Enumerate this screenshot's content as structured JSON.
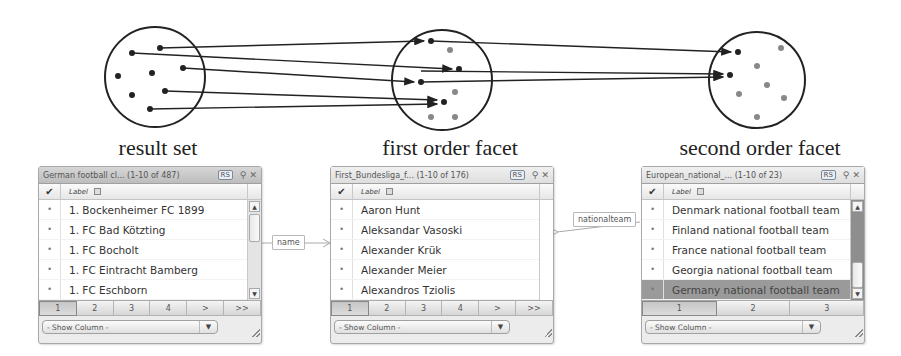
{
  "diagram": {
    "captions": {
      "result_set": "result set",
      "first_order": "first order facet",
      "second_order": "second order facet"
    }
  },
  "panels": [
    {
      "title": "German football cl...",
      "range": "(1-10 of 487)",
      "badge": "RS",
      "column_label": "Label",
      "rows": [
        {
          "label": "1. Bockenheimer FC 1899",
          "selected": false
        },
        {
          "label": "1. FC Bad Kötzting",
          "selected": false
        },
        {
          "label": "1. FC Bocholt",
          "selected": false
        },
        {
          "label": "1. FC Eintracht Bamberg",
          "selected": false
        },
        {
          "label": "1. FC Eschborn",
          "selected": false
        }
      ],
      "pages": [
        "1",
        "2",
        "3",
        "4",
        ">",
        ">>"
      ],
      "active_page": "1",
      "show_column": "- Show Column -"
    },
    {
      "title": "First_Bundesliga_f...",
      "range": "(1-10 of 176)",
      "badge": "RS",
      "column_label": "Label",
      "rows": [
        {
          "label": "Aaron Hunt",
          "selected": false
        },
        {
          "label": "Aleksandar Vasoski",
          "selected": false
        },
        {
          "label": "Alexander Krük",
          "selected": false
        },
        {
          "label": "Alexander Meier",
          "selected": false
        },
        {
          "label": "Alexandros Tziolis",
          "selected": false
        }
      ],
      "pages": [
        "1",
        "2",
        "3",
        "4",
        ">",
        ">>"
      ],
      "active_page": "1",
      "show_column": "- Show Column -"
    },
    {
      "title": "European_national_...",
      "range": "(1-10 of 23)",
      "badge": "RS",
      "column_label": "Label",
      "rows": [
        {
          "label": "Denmark national football team",
          "selected": false
        },
        {
          "label": "Finland national football team",
          "selected": false
        },
        {
          "label": "France national football team",
          "selected": false
        },
        {
          "label": "Georgia national football team",
          "selected": false
        },
        {
          "label": "Germany national football team",
          "selected": true
        }
      ],
      "pages": [
        "1",
        "2",
        "3"
      ],
      "active_page": "1",
      "show_column": "- Show Column -"
    }
  ],
  "edges": [
    {
      "label": "name"
    },
    {
      "label": "nationalteam"
    }
  ],
  "icons": {
    "check": "✔",
    "pin": "⚲",
    "close": "✕",
    "scroll_up": "▲",
    "scroll_down": "▼",
    "dropdown": "▼",
    "bullet": "•"
  }
}
